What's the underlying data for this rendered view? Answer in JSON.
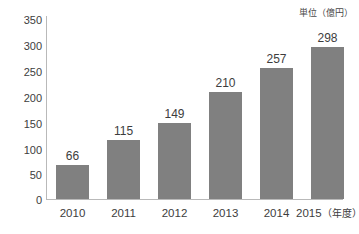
{
  "chart_data": {
    "type": "bar",
    "title": "",
    "subtitle": "",
    "xlabel": "",
    "ylabel": "",
    "unit_note": "単位（億円）",
    "categories": [
      "2010",
      "2011",
      "2012",
      "2013",
      "2014",
      "2015"
    ],
    "category_suffix": "（年度）",
    "values": [
      66,
      115,
      149,
      210,
      257,
      298
    ],
    "ylim": [
      0,
      350
    ],
    "yticks": [
      0,
      50,
      100,
      150,
      200,
      250,
      300,
      350
    ],
    "ytick_labels": [
      "0",
      "50",
      "100",
      "150",
      "200",
      "250",
      "300",
      "350"
    ],
    "value_labels": [
      "66",
      "115",
      "149",
      "210",
      "257",
      "298"
    ],
    "grid": false,
    "legend": false,
    "legend_position": "none",
    "bar_color": "#808080",
    "axis_color": "#b9b9b9",
    "text_color": "#3d3d3d",
    "background_color": "#ffffff"
  }
}
